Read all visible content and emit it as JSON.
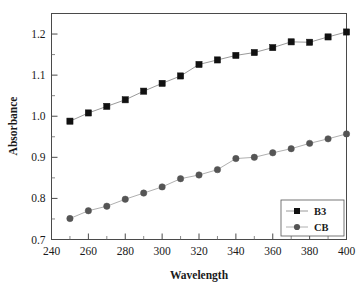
{
  "chart_data": {
    "type": "line",
    "title": "",
    "subtitle": "",
    "xlabel": "Wavelength",
    "ylabel": "Absorbance",
    "xlim": [
      240,
      400
    ],
    "ylim": [
      0.7,
      1.25
    ],
    "x_major_ticks": [
      240,
      260,
      280,
      300,
      320,
      340,
      360,
      380,
      400
    ],
    "x_tick_labels": [
      "240",
      "260",
      "280",
      "300",
      "320",
      "340",
      "360",
      "380",
      "400"
    ],
    "x_minor_ticks": [
      250,
      270,
      290,
      310,
      330,
      350,
      370,
      390
    ],
    "y_major_ticks": [
      0.7,
      0.8,
      0.9,
      1.0,
      1.1,
      1.2
    ],
    "y_tick_labels": [
      "0.7",
      "0.8",
      "0.9",
      "1.0",
      "1.1",
      "1.2"
    ],
    "y_minor_ticks": [
      0.75,
      0.85,
      0.95,
      1.05,
      1.15
    ],
    "grid": false,
    "legend_position": "bottom-right",
    "x": [
      250,
      260,
      270,
      280,
      290,
      300,
      310,
      320,
      330,
      340,
      350,
      360,
      370,
      380,
      390,
      400
    ],
    "series": [
      {
        "name": "B3",
        "marker": "square",
        "marker_color": "#111111",
        "line_color": "#9a9a9a",
        "values": [
          0.988,
          1.008,
          1.024,
          1.04,
          1.061,
          1.08,
          1.098,
          1.126,
          1.137,
          1.148,
          1.155,
          1.167,
          1.181,
          1.18,
          1.193,
          1.205
        ]
      },
      {
        "name": "CB",
        "marker": "circle",
        "marker_color": "#555555",
        "line_color": "#b0b0b0",
        "values": [
          0.751,
          0.77,
          0.781,
          0.798,
          0.813,
          0.828,
          0.848,
          0.857,
          0.87,
          0.897,
          0.9,
          0.911,
          0.921,
          0.934,
          0.945,
          0.957
        ]
      }
    ],
    "annotations": []
  },
  "legend": {
    "entries": [
      {
        "label": "B3"
      },
      {
        "label": "CB"
      }
    ]
  },
  "colors": {
    "axis": "#4a4a4a",
    "text": "#1a1a1a",
    "b3_marker": "#111111",
    "cb_marker": "#555555",
    "background": "#ffffff"
  }
}
